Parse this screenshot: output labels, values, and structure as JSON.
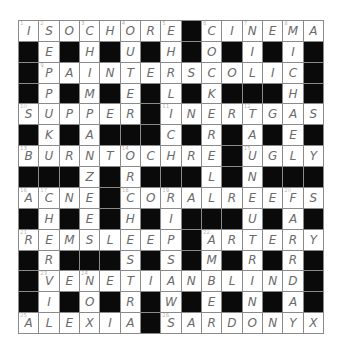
{
  "puzzle": {
    "rows": 15,
    "cols": 15,
    "grid": [
      "ISOCHORE#CINEMA",
      "#E#H#U#H#O#I#I#",
      "#PAINTERSCOLIC#",
      "#P#M#E#L#K###H#",
      "SUPPER#INERTGAS",
      "#K#A###C#R#A#E#",
      "BURNTOCHRE#UGLY",
      "###Z#R###L#N###",
      "ACNE#CORALREEFS",
      "#H#E#H#I###U#A#",
      "REMSLEEP#ARTERY",
      "#R###S#S#M#R#R#",
      "#VENETIANBLIND#",
      "#I#O#R#W#E#N#A#",
      "ALEXIA#SARDONYX"
    ],
    "numbers": [
      {
        "n": "1",
        "r": 0,
        "c": 0
      },
      {
        "n": "2",
        "r": 0,
        "c": 1
      },
      {
        "n": "3",
        "r": 0,
        "c": 3
      },
      {
        "n": "4",
        "r": 0,
        "c": 5
      },
      {
        "n": "5",
        "r": 0,
        "c": 7
      },
      {
        "n": "6",
        "r": 0,
        "c": 9
      },
      {
        "n": "7",
        "r": 0,
        "c": 11
      },
      {
        "n": "8",
        "r": 0,
        "c": 13
      },
      {
        "n": "9",
        "r": 2,
        "c": 1
      },
      {
        "n": "10",
        "r": 4,
        "c": 0
      },
      {
        "n": "11",
        "r": 4,
        "c": 7
      },
      {
        "n": "12",
        "r": 4,
        "c": 11
      },
      {
        "n": "13",
        "r": 6,
        "c": 0
      },
      {
        "n": "14",
        "r": 6,
        "c": 5
      },
      {
        "n": "15",
        "r": 6,
        "c": 11
      },
      {
        "n": "16",
        "r": 8,
        "c": 0
      },
      {
        "n": "17",
        "r": 8,
        "c": 1
      },
      {
        "n": "18",
        "r": 8,
        "c": 5
      },
      {
        "n": "19",
        "r": 8,
        "c": 7
      },
      {
        "n": "20",
        "r": 8,
        "c": 13
      },
      {
        "n": "21",
        "r": 10,
        "c": 0
      },
      {
        "n": "22",
        "r": 10,
        "c": 9
      },
      {
        "n": "23",
        "r": 12,
        "c": 1
      },
      {
        "n": "24",
        "r": 12,
        "c": 3
      },
      {
        "n": "25",
        "r": 14,
        "c": 0
      },
      {
        "n": "26",
        "r": 14,
        "c": 7
      }
    ],
    "colors": {
      "black_cell": "#0a0a0a",
      "white_cell": "#ffffff",
      "grid_line": "#8a8a8a",
      "letter": "#6a6a6a"
    }
  }
}
